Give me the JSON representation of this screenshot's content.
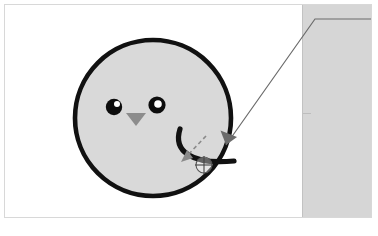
{
  "app": {
    "window_title": "",
    "canvas_background": "#ffffff",
    "frame_border_color": "#d8d8d8"
  },
  "canvas": {
    "name": "drawing-canvas",
    "x": 4,
    "y": 4,
    "width": 368,
    "height": 214
  },
  "side_panel": {
    "name": "right-side-panel",
    "label": "",
    "fill": "#d6d6d6",
    "border": "#c2c2c2",
    "x": 301,
    "y": 0,
    "width": 77,
    "height": 218,
    "divider_y": 112
  },
  "artwork": {
    "name": "smiley-face-illustration",
    "head": {
      "name": "head-circle",
      "cx": 148,
      "cy": 113,
      "r": 78,
      "fill": "#d9d9d9",
      "stroke": "#111111",
      "stroke_width": 4.6
    },
    "left_eye": {
      "name": "left-eye",
      "cx": 109,
      "cy": 102,
      "r": 8.2,
      "fill": "#0d0d0d",
      "highlight": {
        "cx": 112,
        "cy": 99,
        "r": 3.0,
        "fill": "#ffffff"
      }
    },
    "right_eye": {
      "name": "right-eye",
      "cx": 152,
      "cy": 100,
      "r": 8.6,
      "fill": "#0d0d0d",
      "highlight": {
        "cx": 153,
        "cy": 99,
        "r": 3.8,
        "fill": "#ffffff"
      }
    },
    "nose": {
      "name": "nose-triangle",
      "points": "121,108 141,108 131,121",
      "fill": "#8c8c8c"
    },
    "mouth": {
      "name": "mouth-curve",
      "path": "M 175 124 C 168 146 186 160 229 156",
      "stroke": "#111111",
      "stroke_width": 5.2,
      "fill": "none"
    }
  },
  "edit_overlay": {
    "control_point": {
      "name": "crosshair-control-point",
      "cx": 199,
      "cy": 160,
      "r": 8,
      "stroke": "#555555",
      "fill": "rgba(255,255,255,0.35)",
      "stroke_width": 1.1
    },
    "drag_arrow": {
      "name": "drag-direction-arrow",
      "style": "dashed",
      "path": "M 201 131 L 177 156",
      "stroke": "#8a8a8a",
      "stroke_width": 1.6,
      "dash": "4 3"
    },
    "leader_line": {
      "name": "callout-leader-line",
      "path": "M 378 14 L 310 14 L 221 140",
      "stroke": "#6b6b6b",
      "stroke_width": 1.2
    },
    "leader_arrow": {
      "name": "callout-arrow-head",
      "points": "221,140 216,126 232,132",
      "fill": "#6b6b6b"
    }
  },
  "colors": {
    "accent_gray": "#8a8a8a",
    "ink": "#111111",
    "panel": "#d6d6d6",
    "shape_fill": "#d9d9d9"
  }
}
